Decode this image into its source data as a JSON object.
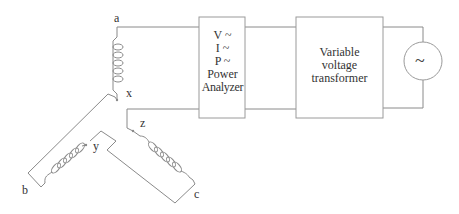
{
  "terminals": {
    "a": "a",
    "x": "x",
    "y": "y",
    "z": "z",
    "b": "b",
    "c": "c"
  },
  "power_analyzer": {
    "lines": [
      "V ~",
      "I ~",
      "P ~",
      "Power",
      "Analyzer"
    ]
  },
  "variable_transformer": {
    "lines": [
      "Variable",
      "voltage",
      "transformer"
    ]
  },
  "ac_source": {
    "symbol": "~"
  },
  "colors": {
    "line": "#8a8a8a",
    "text": "#333333",
    "background": "#ffffff"
  }
}
